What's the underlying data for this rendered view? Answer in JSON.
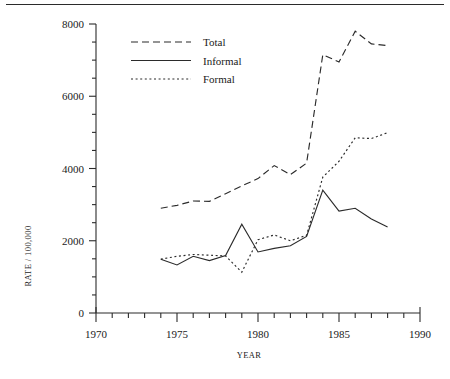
{
  "figure": {
    "top_rule": true,
    "background_color": "#ffffff",
    "ink_color": "#2b2b2b"
  },
  "chart_data": {
    "type": "line",
    "title": "",
    "subtitle": "",
    "xlabel": "YEAR",
    "ylabel": "RATE / 100,000",
    "xlim": [
      1970,
      1990
    ],
    "ylim": [
      0,
      8000
    ],
    "xticks": [
      1970,
      1975,
      1980,
      1985,
      1990
    ],
    "xtick_labels": [
      "1970",
      "1975",
      "1980",
      "1985",
      "1990"
    ],
    "x_minor_tick_step": 1,
    "yticks": [
      0,
      2000,
      4000,
      6000,
      8000
    ],
    "ytick_labels": [
      "0",
      "2000",
      "4000",
      "6000",
      "8000"
    ],
    "y_minor_tick_step": 500,
    "grid": false,
    "legend_position": "upper-left-inside",
    "x": [
      1974,
      1975,
      1976,
      1977,
      1978,
      1979,
      1980,
      1981,
      1982,
      1983,
      1984,
      1985,
      1986,
      1987,
      1988
    ],
    "series": [
      {
        "name": "Total",
        "style": "dashed",
        "dash_pattern": "7,4",
        "values": [
          2900,
          2980,
          3100,
          3090,
          3300,
          3520,
          3720,
          4080,
          3830,
          4150,
          7150,
          6950,
          7800,
          7450,
          7400
        ]
      },
      {
        "name": "Informal",
        "style": "solid",
        "dash_pattern": "none",
        "values": [
          1490,
          1330,
          1570,
          1450,
          1590,
          2460,
          1690,
          1790,
          1860,
          2120,
          3400,
          2820,
          2900,
          2600,
          2380
        ]
      },
      {
        "name": "Formal",
        "style": "dotted",
        "dash_pattern": "2,2.6",
        "values": [
          1490,
          1570,
          1620,
          1600,
          1580,
          1130,
          2030,
          2160,
          2000,
          2150,
          3760,
          4200,
          4850,
          4830,
          4990
        ]
      }
    ]
  },
  "legend": {
    "items": [
      {
        "label": "Total"
      },
      {
        "label": "Informal"
      },
      {
        "label": "Formal"
      }
    ]
  }
}
